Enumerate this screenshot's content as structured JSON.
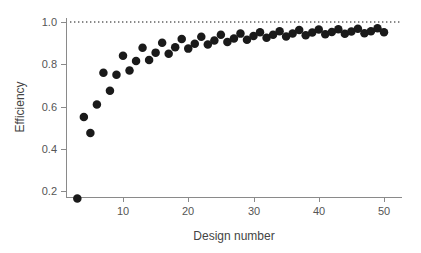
{
  "chart_data": {
    "type": "scatter",
    "title": "",
    "xlabel": "Design number",
    "ylabel": "Efficiency",
    "xlim": [
      1.5,
      52.5
    ],
    "ylim": [
      0.1,
      1.04
    ],
    "grid": false,
    "legend": "none",
    "x_ticks": [
      10,
      20,
      30,
      40,
      50
    ],
    "y_ticks": [
      0.2,
      0.4,
      0.6,
      0.8,
      1.0
    ],
    "x_tick_labels": [
      "10",
      "20",
      "30",
      "40",
      "50"
    ],
    "y_tick_labels": [
      "0.2",
      "0.4",
      "0.6",
      "0.8",
      "1.0"
    ],
    "annotations": [
      {
        "name": "reference-line",
        "type": "horizontal-dotted-line",
        "y": 1.0,
        "label": "1.0",
        "color": "#111111"
      }
    ],
    "marker": {
      "shape": "circle",
      "filled": true,
      "color": "#1a1a1a",
      "size_px": 4.3
    },
    "x": [
      3,
      4,
      5,
      6,
      7,
      8,
      9,
      10,
      11,
      12,
      13,
      14,
      15,
      16,
      17,
      18,
      19,
      20,
      21,
      22,
      23,
      24,
      25,
      26,
      27,
      28,
      29,
      30,
      31,
      32,
      33,
      34,
      35,
      36,
      37,
      38,
      39,
      40,
      41,
      42,
      43,
      44,
      45,
      46,
      47,
      48,
      49,
      50
    ],
    "y": [
      0.165,
      0.55,
      0.475,
      0.61,
      0.76,
      0.675,
      0.75,
      0.84,
      0.77,
      0.815,
      0.878,
      0.82,
      0.855,
      0.902,
      0.85,
      0.88,
      0.92,
      0.874,
      0.897,
      0.93,
      0.893,
      0.912,
      0.94,
      0.905,
      0.922,
      0.945,
      0.916,
      0.934,
      0.952,
      0.925,
      0.94,
      0.956,
      0.931,
      0.946,
      0.962,
      0.937,
      0.95,
      0.964,
      0.942,
      0.953,
      0.966,
      0.944,
      0.955,
      0.968,
      0.947,
      0.956,
      0.97,
      0.952
    ],
    "series_name": "Design efficiency",
    "n_points": 48
  },
  "axes": {
    "x_axis_name": "design-number-axis",
    "y_axis_name": "efficiency-axis"
  }
}
